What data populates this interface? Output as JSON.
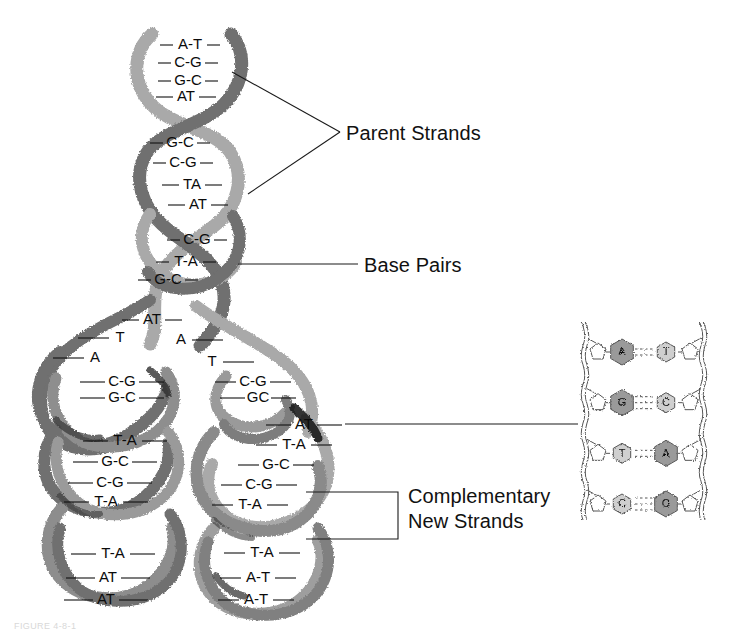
{
  "figure": {
    "background": "#ffffff",
    "colors": {
      "strand_light": "#a9a9a9",
      "strand_dark": "#6f6f6f",
      "strand_shadow": "#3a3a3a",
      "line": "#1a1a1a",
      "text": "#111111",
      "inset_base_fill": "#9a9a9a",
      "inset_base_light": "#cfcfcf",
      "inset_outline": "#555555"
    }
  },
  "labels": {
    "parent_strands": "Parent Strands",
    "base_pairs": "Base Pairs",
    "complementary_new_strands_line1": "Complementary",
    "complementary_new_strands_line2": "New Strands"
  },
  "caption": "FIGURE 4-8-1",
  "parent_helix": {
    "name": "Parent double helix (unreplicated, top)",
    "segments": [
      {
        "segment": "top-turn",
        "base_pairs": [
          {
            "left": "A",
            "right": "T",
            "label": "A-T",
            "x": 190,
            "y": 45
          },
          {
            "left": "C",
            "right": "G",
            "label": "C-G",
            "x": 188,
            "y": 63
          },
          {
            "left": "G",
            "right": "C",
            "label": "G-C",
            "x": 188,
            "y": 81
          },
          {
            "left": "A",
            "right": "T",
            "label": "AT",
            "x": 186,
            "y": 97
          }
        ]
      },
      {
        "segment": "second-turn",
        "base_pairs": [
          {
            "left": "G",
            "right": "C",
            "label": "G-C",
            "x": 180,
            "y": 143
          },
          {
            "left": "C",
            "right": "G",
            "label": "C-G",
            "x": 183,
            "y": 163
          },
          {
            "left": "T",
            "right": "A",
            "label": "TA",
            "x": 192,
            "y": 185
          },
          {
            "left": "A",
            "right": "T",
            "label": "AT",
            "x": 198,
            "y": 205
          }
        ]
      },
      {
        "segment": "third-turn",
        "base_pairs": [
          {
            "left": "C",
            "right": "G",
            "label": "C-G",
            "x": 197,
            "y": 240
          },
          {
            "left": "T",
            "right": "A",
            "label": "T-A",
            "x": 186,
            "y": 262
          },
          {
            "left": "G",
            "right": "C",
            "label": "G-C",
            "x": 168,
            "y": 280
          },
          {
            "left": "A",
            "right": "T",
            "label": "AT",
            "x": 152,
            "y": 320
          }
        ]
      }
    ]
  },
  "replication_fork": {
    "name": "Unpaired bases at the replication fork",
    "left_unpaired": [
      {
        "base": "T",
        "x": 120,
        "y": 338
      },
      {
        "base": "A",
        "x": 95,
        "y": 358
      }
    ],
    "right_unpaired": [
      {
        "base": "A",
        "x": 181,
        "y": 340
      },
      {
        "base": "T",
        "x": 212,
        "y": 362
      }
    ]
  },
  "daughter_left": {
    "name": "Left daughter duplex (template + complementary new strand)",
    "base_pairs": [
      {
        "left": "C",
        "right": "G",
        "label": "C-G",
        "x": 122,
        "y": 382
      },
      {
        "left": "G",
        "right": "C",
        "label": "G-C",
        "x": 122,
        "y": 398
      },
      {
        "left": "T",
        "right": "A",
        "label": "T-A",
        "x": 125,
        "y": 441
      },
      {
        "left": "G",
        "right": "C",
        "label": "G-C",
        "x": 115,
        "y": 462
      },
      {
        "left": "C",
        "right": "G",
        "label": "C-G",
        "x": 110,
        "y": 483
      },
      {
        "left": "T",
        "right": "A",
        "label": "T-A",
        "x": 106,
        "y": 502
      },
      {
        "left": "T",
        "right": "A",
        "label": "T-A",
        "x": 113,
        "y": 554
      },
      {
        "left": "A",
        "right": "T",
        "label": "AT",
        "x": 108,
        "y": 578
      },
      {
        "left": "A",
        "right": "T",
        "label": "AT",
        "x": 106,
        "y": 600
      }
    ]
  },
  "daughter_right": {
    "name": "Right daughter duplex (template + complementary new strand)",
    "base_pairs": [
      {
        "left": "C",
        "right": "G",
        "label": "C-G",
        "x": 253,
        "y": 382
      },
      {
        "left": "G",
        "right": "C",
        "label": "GC",
        "x": 258,
        "y": 398
      },
      {
        "left": "A",
        "right": "T",
        "label": "AT",
        "x": 304,
        "y": 425
      },
      {
        "left": "T",
        "right": "A",
        "label": "T-A",
        "x": 294,
        "y": 445
      },
      {
        "left": "G",
        "right": "C",
        "label": "G-C",
        "x": 276,
        "y": 465
      },
      {
        "left": "C",
        "right": "G",
        "label": "C-G",
        "x": 259,
        "y": 485
      },
      {
        "left": "T",
        "right": "A",
        "label": "T-A",
        "x": 250,
        "y": 505
      },
      {
        "left": "T",
        "right": "A",
        "label": "T-A",
        "x": 262,
        "y": 553
      },
      {
        "left": "A",
        "right": "T",
        "label": "A-T",
        "x": 258,
        "y": 578
      },
      {
        "left": "A",
        "right": "T",
        "label": "A-T",
        "x": 256,
        "y": 600
      }
    ]
  },
  "inset": {
    "name": "Close-up of hydrogen-bonded base pairs",
    "x": 578,
    "y": 330,
    "width": 132,
    "height": 186,
    "base_pairs": [
      {
        "left": "A",
        "right": "T",
        "left_size": "purine",
        "right_size": "pyrimidine",
        "bonds": 2
      },
      {
        "left": "G",
        "right": "C",
        "left_size": "purine",
        "right_size": "pyrimidine",
        "bonds": 3
      },
      {
        "left": "T",
        "right": "A",
        "left_size": "pyrimidine",
        "right_size": "purine",
        "bonds": 2
      },
      {
        "left": "C",
        "right": "G",
        "left_size": "pyrimidine",
        "right_size": "purine",
        "bonds": 3
      }
    ]
  },
  "leaders": {
    "parent_upper": {
      "from_x": 232,
      "from_y": 72,
      "to_x": 340,
      "to_y": 132
    },
    "parent_lower": {
      "from_x": 248,
      "from_y": 194,
      "to_x": 340,
      "to_y": 132
    },
    "base_pairs": {
      "from_x": 238,
      "from_y": 264,
      "to_x": 358,
      "to_y": 264
    },
    "inset": {
      "from_x": 345,
      "from_y": 424,
      "to_x": 578,
      "to_y": 424
    },
    "bracket": {
      "x_left": 306,
      "x_right": 398,
      "y_top": 492,
      "y_bottom": 539
    }
  }
}
